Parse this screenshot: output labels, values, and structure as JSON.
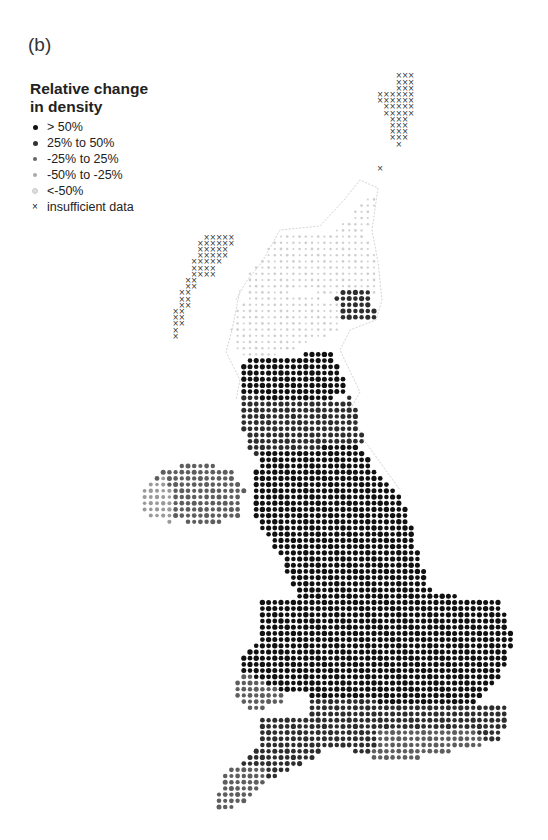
{
  "figure": {
    "panel_label": "(b)",
    "legend": {
      "title_line1": "Relative change",
      "title_line2": "in density",
      "items": [
        {
          "label": "> 50%",
          "color": "#111111",
          "size": 5
        },
        {
          "label": "25% to 50%",
          "color": "#333333",
          "size": 5
        },
        {
          "label": "-25% to 25%",
          "color": "#666666",
          "size": 4.5
        },
        {
          "label": "-50% to -25%",
          "color": "#aaaaaa",
          "size": 4.5
        },
        {
          "label": "<-50%",
          "color": "#dddddd",
          "size": 4
        },
        {
          "label": "insufficient data",
          "symbol": "×",
          "color": "#222222"
        }
      ]
    },
    "map": {
      "grid_spacing": 6.2,
      "categories": {
        "gt50": {
          "color": "#111111",
          "r": 2.7
        },
        "p25_50": {
          "color": "#2e2e2e",
          "r": 2.6
        },
        "m25_25": {
          "color": "#5e5e5e",
          "r": 2.5
        },
        "m50_m25": {
          "color": "#9a9a9a",
          "r": 2.2
        },
        "lt_m50": {
          "color": "#cfcfcf",
          "r": 1.4
        },
        "insufficient": {
          "color": "#333333",
          "symbol": "x"
        }
      },
      "regions": [
        {
          "name": "shetland-orkney",
          "cat": "insufficient",
          "poly": [
            [
              396,
              74
            ],
            [
              412,
              74
            ],
            [
              414,
              100
            ],
            [
              404,
              148
            ],
            [
              394,
              148
            ],
            [
              386,
              112
            ],
            [
              376,
              100
            ],
            [
              380,
              90
            ],
            [
              396,
              90
            ]
          ]
        },
        {
          "name": "shetland-outlier",
          "cat": "insufficient",
          "poly": [
            [
              378,
              164
            ],
            [
              384,
              164
            ],
            [
              384,
              172
            ],
            [
              378,
              172
            ]
          ]
        },
        {
          "name": "outer-hebrides",
          "cat": "insufficient",
          "poly": [
            [
              218,
              232
            ],
            [
              232,
              232
            ],
            [
              234,
              244
            ],
            [
              222,
              262
            ],
            [
              210,
              278
            ],
            [
              200,
              276
            ],
            [
              190,
              300
            ],
            [
              184,
              318
            ],
            [
              178,
              340
            ],
            [
              170,
              340
            ],
            [
              172,
              316
            ],
            [
              180,
              292
            ],
            [
              190,
              274
            ],
            [
              196,
              256
            ],
            [
              198,
              238
            ]
          ]
        },
        {
          "name": "isle-of-man",
          "cat": "insufficient",
          "poly": [
            [
              264,
              506
            ],
            [
              284,
              506
            ],
            [
              284,
              530
            ],
            [
              262,
              530
            ]
          ]
        },
        {
          "name": "north-highlands-sparse",
          "cat": "lt_m50",
          "poly": [
            [
              278,
              236
            ],
            [
              330,
              232
            ],
            [
              350,
              220
            ],
            [
              366,
              192
            ],
            [
              376,
              200
            ],
            [
              366,
              236
            ],
            [
              378,
              262
            ],
            [
              380,
              296
            ],
            [
              356,
              300
            ],
            [
              300,
              290
            ],
            [
              260,
              300
            ],
            [
              250,
              310
            ],
            [
              244,
              280
            ]
          ]
        },
        {
          "name": "grampian",
          "cat": "p25_50",
          "poly": [
            [
              340,
              290
            ],
            [
              372,
              290
            ],
            [
              376,
              320
            ],
            [
              346,
              322
            ],
            [
              330,
              306
            ]
          ]
        },
        {
          "name": "central-highlands",
          "cat": "lt_m50",
          "poly": [
            [
              240,
              300
            ],
            [
              300,
              294
            ],
            [
              340,
              302
            ],
            [
              340,
              330
            ],
            [
              300,
              346
            ],
            [
              262,
              360
            ],
            [
              240,
              360
            ],
            [
              230,
              330
            ]
          ]
        },
        {
          "name": "central-belt",
          "cat": "gt50",
          "poly": [
            [
              244,
              360
            ],
            [
              330,
              352
            ],
            [
              350,
              388
            ],
            [
              320,
              404
            ],
            [
              270,
              410
            ],
            [
              238,
              396
            ]
          ]
        },
        {
          "name": "southern-uplands",
          "cat": "p25_50",
          "poly": [
            [
              238,
              396
            ],
            [
              320,
              404
            ],
            [
              352,
              396
            ],
            [
              364,
              440
            ],
            [
              340,
              470
            ],
            [
              270,
              472
            ],
            [
              246,
              448
            ]
          ]
        },
        {
          "name": "northern-ireland",
          "cat": "m25_25",
          "poly": [
            [
              164,
              470
            ],
            [
              200,
              460
            ],
            [
              230,
              470
            ],
            [
              246,
              488
            ],
            [
              238,
              520
            ],
            [
              196,
              524
            ],
            [
              150,
              512
            ],
            [
              144,
              492
            ]
          ]
        },
        {
          "name": "northern-ireland-west",
          "cat": "m50_m25",
          "poly": [
            [
              140,
              488
            ],
            [
              164,
              476
            ],
            [
              176,
              500
            ],
            [
              170,
              522
            ],
            [
              144,
              514
            ]
          ]
        },
        {
          "name": "north-england",
          "cat": "gt50",
          "poly": [
            [
              258,
              450
            ],
            [
              356,
              446
            ],
            [
              404,
              500
            ],
            [
              420,
              560
            ],
            [
              430,
              590
            ],
            [
              360,
              604
            ],
            [
              300,
              600
            ],
            [
              282,
              560
            ],
            [
              256,
              520
            ],
            [
              256,
              470
            ]
          ]
        },
        {
          "name": "wales",
          "cat": "gt50",
          "poly": [
            [
              262,
              602
            ],
            [
              300,
              600
            ],
            [
              304,
              640
            ],
            [
              300,
              690
            ],
            [
              262,
              700
            ],
            [
              236,
              690
            ],
            [
              240,
              660
            ],
            [
              262,
              640
            ]
          ]
        },
        {
          "name": "wales-south",
          "cat": "m25_25",
          "poly": [
            [
              238,
              672
            ],
            [
              262,
              680
            ],
            [
              290,
              700
            ],
            [
              256,
              712
            ],
            [
              236,
              700
            ]
          ]
        },
        {
          "name": "midlands-east",
          "cat": "gt50",
          "poly": [
            [
              300,
              598
            ],
            [
              430,
              592
            ],
            [
              500,
              602
            ],
            [
              514,
              640
            ],
            [
              500,
              680
            ],
            [
              470,
              710
            ],
            [
              330,
              710
            ],
            [
              300,
              690
            ]
          ]
        },
        {
          "name": "south-east",
          "cat": "p25_50",
          "poly": [
            [
              310,
              700
            ],
            [
              470,
              704
            ],
            [
              510,
              708
            ],
            [
              500,
              740
            ],
            [
              440,
              748
            ],
            [
              360,
              752
            ],
            [
              300,
              744
            ]
          ]
        },
        {
          "name": "south-coast",
          "cat": "m25_25",
          "poly": [
            [
              380,
              730
            ],
            [
              470,
              728
            ],
            [
              484,
              744
            ],
            [
              420,
              758
            ],
            [
              370,
              760
            ]
          ]
        },
        {
          "name": "south-west",
          "cat": "p25_50",
          "poly": [
            [
              262,
              718
            ],
            [
              310,
              716
            ],
            [
              320,
              756
            ],
            [
              292,
              770
            ],
            [
              266,
              780
            ],
            [
              240,
              794
            ],
            [
              224,
              808
            ],
            [
              218,
              798
            ],
            [
              236,
              772
            ],
            [
              256,
              748
            ]
          ]
        },
        {
          "name": "cornwall",
          "cat": "m25_25",
          "poly": [
            [
              226,
              770
            ],
            [
              262,
              766
            ],
            [
              270,
              780
            ],
            [
              250,
              800
            ],
            [
              226,
              812
            ],
            [
              214,
              808
            ],
            [
              220,
              790
            ]
          ]
        }
      ],
      "coast_outlines": [
        [
          [
            262,
            262
          ],
          [
            280,
            230
          ],
          [
            320,
            226
          ],
          [
            344,
            200
          ],
          [
            360,
            180
          ],
          [
            378,
            188
          ],
          [
            372,
            230
          ],
          [
            378,
            262
          ],
          [
            382,
            300
          ],
          [
            376,
            320
          ],
          [
            350,
            330
          ],
          [
            340,
            350
          ],
          [
            360,
            392
          ],
          [
            350,
            410
          ],
          [
            364,
            440
          ],
          [
            400,
            490
          ]
        ],
        [
          [
            236,
            300
          ],
          [
            246,
            282
          ],
          [
            262,
            262
          ]
        ],
        [
          [
            240,
            290
          ],
          [
            232,
            330
          ],
          [
            226,
            352
          ],
          [
            240,
            380
          ],
          [
            236,
            400
          ]
        ]
      ]
    }
  }
}
